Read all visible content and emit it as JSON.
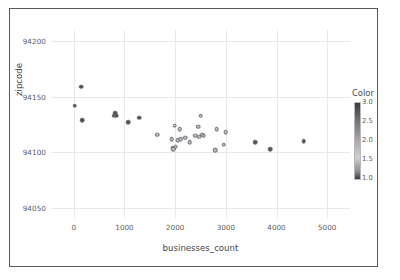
{
  "chart_data": {
    "type": "scatter",
    "title": "",
    "xlabel": "businesses_count",
    "ylabel": "zipcode",
    "xlim": [
      -450,
      5450
    ],
    "ylim": [
      94040,
      94210
    ],
    "grid": true,
    "xticks": [
      0,
      1000,
      2000,
      3000,
      4000,
      5000
    ],
    "xtick_labels": [
      "0",
      "1000",
      "2000",
      "3000",
      "4000",
      "5000"
    ],
    "yticks": [
      94050,
      94100,
      94150,
      94200
    ],
    "ytick_labels": [
      "94050",
      "94100",
      "94150",
      "94200"
    ],
    "legend": {
      "title": "Color",
      "position": "right",
      "type": "colorbar",
      "ticks": [
        1.0,
        1.5,
        2.0,
        2.5,
        3.0
      ],
      "tick_labels": [
        "1.0",
        "1.5",
        "2.0",
        "2.5",
        "3.0"
      ],
      "vmin": 1.0,
      "vmax": 3.0,
      "colormap_low": "#3d3d41",
      "colormap_mid": "#cfcfd3",
      "colormap_high": "#3a3a3e"
    },
    "marker": {
      "shape": "circle",
      "size": 4.6,
      "edge_color": "#6b6b72"
    },
    "points": [
      {
        "x": 20,
        "y": 94142,
        "color": 1.05,
        "fill": "#4a4a50"
      },
      {
        "x": 150,
        "y": 94159,
        "color": 1.05,
        "fill": "#4a4a50"
      },
      {
        "x": 160,
        "y": 94129,
        "color": 1.05,
        "fill": "#4a4a50"
      },
      {
        "x": 790,
        "y": 94133,
        "color": 1.1,
        "fill": "#4d4d53"
      },
      {
        "x": 820,
        "y": 94135,
        "color": 1.1,
        "fill": "#4d4d53"
      },
      {
        "x": 840,
        "y": 94133,
        "color": 1.1,
        "fill": "#4d4d53"
      },
      {
        "x": 1070,
        "y": 94127,
        "color": 1.15,
        "fill": "#4f4f55"
      },
      {
        "x": 1290,
        "y": 94131,
        "color": 1.15,
        "fill": "#4f4f55"
      },
      {
        "x": 1640,
        "y": 94116,
        "color": 2.4,
        "fill": "#b9b9be"
      },
      {
        "x": 1930,
        "y": 94112,
        "color": 2.5,
        "fill": "#bcbcc1"
      },
      {
        "x": 1950,
        "y": 94104,
        "color": 2.5,
        "fill": "#bcbcc1"
      },
      {
        "x": 1960,
        "y": 94103,
        "color": 2.5,
        "fill": "#bcbcc1"
      },
      {
        "x": 1990,
        "y": 94124,
        "color": 2.55,
        "fill": "#bfbfc4"
      },
      {
        "x": 2010,
        "y": 94105,
        "color": 2.55,
        "fill": "#bfbfc4"
      },
      {
        "x": 2050,
        "y": 94111,
        "color": 2.5,
        "fill": "#bcbcc1"
      },
      {
        "x": 2090,
        "y": 94121,
        "color": 2.55,
        "fill": "#bfbfc4"
      },
      {
        "x": 2110,
        "y": 94112,
        "color": 2.5,
        "fill": "#bcbcc1"
      },
      {
        "x": 2200,
        "y": 94113,
        "color": 2.5,
        "fill": "#bcbcc1"
      },
      {
        "x": 2290,
        "y": 94109,
        "color": 2.5,
        "fill": "#bcbcc1"
      },
      {
        "x": 2400,
        "y": 94115,
        "color": 2.55,
        "fill": "#bfbfc4"
      },
      {
        "x": 2460,
        "y": 94123,
        "color": 2.55,
        "fill": "#bfbfc4"
      },
      {
        "x": 2470,
        "y": 94114,
        "color": 2.5,
        "fill": "#bcbcc1"
      },
      {
        "x": 2500,
        "y": 94133,
        "color": 2.6,
        "fill": "#c2c2c7"
      },
      {
        "x": 2530,
        "y": 94116,
        "color": 2.5,
        "fill": "#bcbcc1"
      },
      {
        "x": 2560,
        "y": 94115,
        "color": 2.5,
        "fill": "#bcbcc1"
      },
      {
        "x": 2790,
        "y": 94102,
        "color": 2.45,
        "fill": "#b9b9be"
      },
      {
        "x": 2820,
        "y": 94121,
        "color": 2.55,
        "fill": "#bfbfc4"
      },
      {
        "x": 2960,
        "y": 94107,
        "color": 2.45,
        "fill": "#b9b9be"
      },
      {
        "x": 3000,
        "y": 94118,
        "color": 2.55,
        "fill": "#bfbfc4"
      },
      {
        "x": 3580,
        "y": 94109,
        "color": 1.2,
        "fill": "#525258"
      },
      {
        "x": 3880,
        "y": 94103,
        "color": 1.2,
        "fill": "#525258"
      },
      {
        "x": 4540,
        "y": 94110,
        "color": 1.2,
        "fill": "#525258"
      }
    ]
  }
}
